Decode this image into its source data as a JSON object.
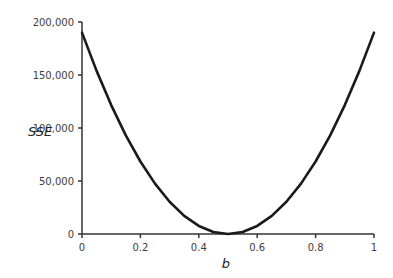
{
  "chart_data": {
    "type": "line",
    "title": "",
    "xlabel": "b",
    "ylabel": "SSE",
    "xlim": [
      0,
      1
    ],
    "ylim": [
      0,
      200000
    ],
    "x_ticks": [
      0,
      0.2,
      0.4,
      0.6,
      0.8,
      1
    ],
    "x_tick_labels": [
      "0",
      "0.2",
      "0.4",
      "0.6",
      "0.8",
      "1"
    ],
    "y_ticks": [
      0,
      50000,
      100000,
      150000,
      200000
    ],
    "y_tick_labels": [
      "0",
      "50,000",
      "100,000",
      "150,000",
      "200,000"
    ],
    "grid": false,
    "legend": null,
    "series": [
      {
        "name": "SSE",
        "x": [
          0,
          0.05,
          0.1,
          0.15,
          0.2,
          0.25,
          0.3,
          0.35,
          0.4,
          0.45,
          0.5,
          0.55,
          0.6,
          0.65,
          0.7,
          0.75,
          0.8,
          0.85,
          0.9,
          0.95,
          1.0
        ],
        "values": [
          190000,
          153900,
          121600,
          93100,
          68400,
          47500,
          30400,
          17100,
          7600,
          1900,
          0,
          1900,
          7600,
          17100,
          30400,
          47500,
          68400,
          93100,
          121600,
          153900,
          190000
        ]
      }
    ],
    "color": "#1a1a1a"
  }
}
